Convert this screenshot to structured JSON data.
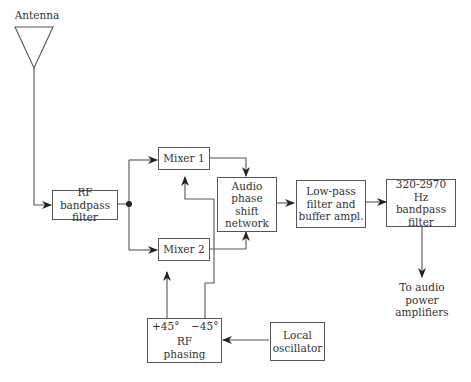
{
  "diagram": {
    "antenna": {
      "label": "Antenna"
    },
    "blocks": {
      "rf_bandpass": "RF bandpass\nfilter",
      "mixer1": "Mixer 1",
      "mixer2": "Mixer 2",
      "audio_phase": "Audio\nphase\nshift\nnetwork",
      "lowpass": "Low-pass\nfilter and\nbuffer ampl.",
      "hz_bandpass": "320-2970\nHz bandpass\nfilter",
      "rf_phasing": "RF\nphasing",
      "local_osc": "Local\noscillator"
    },
    "phasing_ports": {
      "plus": "+45°",
      "minus": "−45°"
    },
    "output": {
      "label": "To audio\npower\namplifiers"
    },
    "line_color": "#555555"
  }
}
